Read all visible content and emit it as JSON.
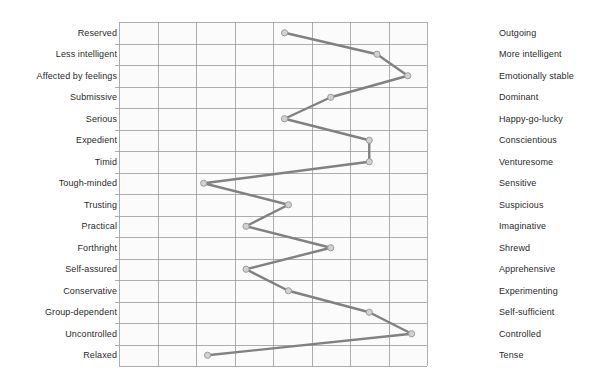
{
  "chart_data": {
    "type": "line",
    "orientation": "horizontal",
    "title": "",
    "subtitle": "",
    "xlabel": "",
    "ylabel": "",
    "xlim": [
      1,
      9
    ],
    "grid": true,
    "grid_columns": 8,
    "legend": "none",
    "left_labels": [
      "Reserved",
      "Less intelligent",
      "Affected by feelings",
      "Submissive",
      "Serious",
      "Expedient",
      "Timid",
      "Tough-minded",
      "Trusting",
      "Practical",
      "Forthright",
      "Self-assured",
      "Conservative",
      "Group-dependent",
      "Uncontrolled",
      "Relaxed"
    ],
    "right_labels": [
      "Outgoing",
      "More  intelligent",
      "Emotionally stable",
      "Dominant",
      "Happy-go-lucky",
      "Conscientious",
      "Venturesome",
      "Sensitive",
      "Suspicious",
      "Imaginative",
      "Shrewd",
      "Apprehensive",
      "Experimenting",
      "Self-sufficient",
      "Controlled",
      "Tense"
    ],
    "categories": [
      "Reserved / Outgoing",
      "Less intelligent / More intelligent",
      "Affected by feelings / Emotionally stable",
      "Submissive / Dominant",
      "Serious / Happy-go-lucky",
      "Expedient / Conscientious",
      "Timid / Venturesome",
      "Tough-minded / Sensitive",
      "Trusting / Suspicious",
      "Practical / Imaginative",
      "Forthright / Shrewd",
      "Self-assured / Apprehensive",
      "Conservative / Experimenting",
      "Group-dependent / Self-sufficient",
      "Uncontrolled / Controlled",
      "Relaxed / Tense"
    ],
    "values": [
      5.3,
      7.7,
      8.5,
      6.5,
      5.3,
      7.5,
      7.5,
      3.2,
      5.4,
      4.3,
      6.5,
      4.3,
      5.4,
      7.5,
      8.6,
      3.3
    ],
    "colors": {
      "line": "#818181",
      "marker_fill": "#d2d2d2",
      "marker_stroke": "#9c9c9c",
      "grid": "#8d8d8d",
      "plot_background": "#fbfbfb",
      "label_text": "#2b2b2b"
    }
  }
}
